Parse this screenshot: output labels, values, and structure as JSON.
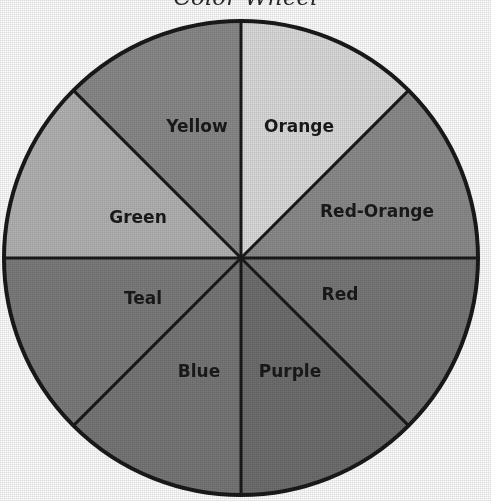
{
  "page": {
    "background_color": "#ffffff",
    "width": 491,
    "height": 501,
    "title_remnant": "Color Wheel"
  },
  "chart_data": {
    "type": "pie",
    "title": "Color Wheel",
    "xlabel": "",
    "ylabel": "",
    "legend_position": "none",
    "grid": false,
    "note": "Eight equal 45-degree wedges; rendered in grayscale (scanned / photocopied page). Labels are placed inside each wedge.",
    "center": {
      "x": 241,
      "y": 258
    },
    "radius": 237,
    "outline_color": "#1a1a1a",
    "outline_width": 4,
    "divider_color": "#1a1a1a",
    "divider_width": 3,
    "categories": [
      "Yellow",
      "Orange",
      "Red-Orange",
      "Red",
      "Purple",
      "Blue",
      "Teal",
      "Green"
    ],
    "values": [
      12.5,
      12.5,
      12.5,
      12.5,
      12.5,
      12.5,
      12.5,
      12.5
    ],
    "slices": [
      {
        "label": "Yellow",
        "value": 12.5,
        "start_angle": 270,
        "end_angle": 315,
        "gray": "#dcdcdc",
        "label_x": 197,
        "label_y": 127
      },
      {
        "label": "Orange",
        "value": 12.5,
        "start_angle": 315,
        "end_angle": 0,
        "gray": "#8c8c8c",
        "label_x": 299,
        "label_y": 127
      },
      {
        "label": "Red-Orange",
        "value": 12.5,
        "start_angle": 0,
        "end_angle": 45,
        "gray": "#797979",
        "label_x": 377,
        "label_y": 212
      },
      {
        "label": "Red",
        "value": 12.5,
        "start_angle": 45,
        "end_angle": 90,
        "gray": "#6f6f6f",
        "label_x": 340,
        "label_y": 295
      },
      {
        "label": "Purple",
        "value": 12.5,
        "start_angle": 90,
        "end_angle": 135,
        "gray": "#787878",
        "label_x": 290,
        "label_y": 372
      },
      {
        "label": "Blue",
        "value": 12.5,
        "start_angle": 135,
        "end_angle": 180,
        "gray": "#7d7d7d",
        "label_x": 199,
        "label_y": 372
      },
      {
        "label": "Teal",
        "value": 12.5,
        "start_angle": 180,
        "end_angle": 225,
        "gray": "#b4b4b4",
        "label_x": 143,
        "label_y": 299
      },
      {
        "label": "Green",
        "value": 12.5,
        "start_angle": 225,
        "end_angle": 270,
        "gray": "#8a8a8a",
        "label_x": 138,
        "label_y": 218
      }
    ]
  }
}
